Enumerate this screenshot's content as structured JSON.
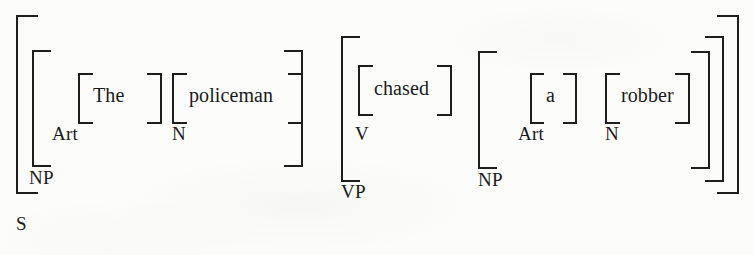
{
  "diagram": {
    "type": "labeled-bracketing",
    "sentence": "The policeman chased a robber",
    "ink_color": "#1e1e1e",
    "background_color": "#fcfcfa",
    "words": [
      {
        "id": "the",
        "text": "The"
      },
      {
        "id": "policeman",
        "text": "policeman"
      },
      {
        "id": "chased",
        "text": "chased"
      },
      {
        "id": "a",
        "text": "a"
      },
      {
        "id": "robber",
        "text": "robber"
      }
    ],
    "labels": [
      {
        "id": "art1",
        "text": "Art"
      },
      {
        "id": "n1",
        "text": "N"
      },
      {
        "id": "np1",
        "text": "NP"
      },
      {
        "id": "s",
        "text": "S"
      },
      {
        "id": "v",
        "text": "V"
      },
      {
        "id": "vp",
        "text": "VP"
      },
      {
        "id": "art2",
        "text": "Art"
      },
      {
        "id": "n2",
        "text": "N"
      },
      {
        "id": "np2",
        "text": "NP"
      }
    ]
  }
}
